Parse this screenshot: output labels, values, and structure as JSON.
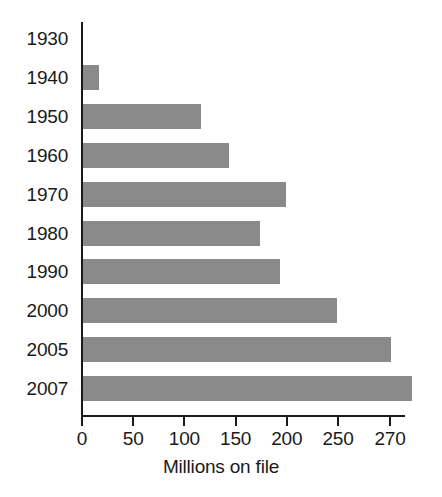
{
  "chart_data": {
    "type": "bar",
    "orientation": "horizontal",
    "title": "",
    "xlabel": "Millions on file",
    "ylabel": "",
    "categories": [
      "1930",
      "1940",
      "1950",
      "1960",
      "1970",
      "1980",
      "1990",
      "2000",
      "2005",
      "2007"
    ],
    "values": [
      0,
      16,
      115,
      143,
      198,
      173,
      192,
      248,
      270,
      278
    ],
    "xticks": [
      0,
      50,
      100,
      150,
      200,
      250,
      270
    ],
    "xtick_labels": [
      "0",
      "50",
      "100",
      "150",
      "200",
      "250",
      "270"
    ],
    "xlim": [
      0,
      280
    ],
    "grid": false,
    "legend": false,
    "bar_color": "#8a8a8a",
    "axis_color": "#1a1a1a",
    "background": "#ffffff"
  },
  "figure": {
    "axis_title": "Millions on file"
  }
}
